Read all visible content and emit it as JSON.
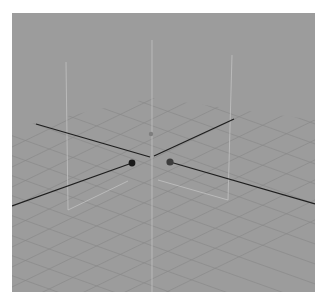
{
  "viewport": {
    "label": "",
    "background": "#9c9c9c",
    "grid_color": "#8c8c8c",
    "axis_color": "#1e1e1e",
    "bbox_color": "#c4c4c4"
  },
  "scene": {
    "origin": [
      152,
      157
    ],
    "markers": [
      {
        "name": "x-axis-handle",
        "x": 132,
        "y": 163,
        "color": "#1a1a1a"
      },
      {
        "name": "z-axis-handle",
        "x": 170,
        "y": 162,
        "color": "#3c3c3c"
      },
      {
        "name": "y-axis-handle",
        "x": 151,
        "y": 134,
        "color": "#7a7a7a"
      }
    ]
  }
}
